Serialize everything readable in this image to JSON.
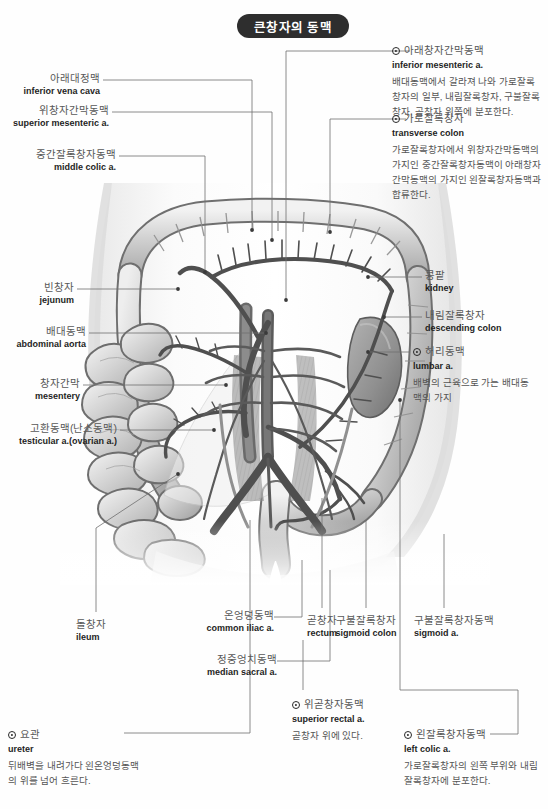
{
  "page": {
    "title_ko": "큰창자의 동맥",
    "background": "#ffffff",
    "title_pill_color": "#2e2e2e"
  },
  "illustration": {
    "name": "large-intestine-arteries-anatomy",
    "style": "grayscale-medical-illustration",
    "palette": {
      "outline": "#4a4a4a",
      "mid_gray": "#9a9a9a",
      "light_gray": "#d8d8d8",
      "vessel_dark": "#5c5c5c",
      "shadow": "#8e8e8e"
    }
  },
  "labels_left": [
    {
      "ko": "아래대정맥",
      "en": "inferior vena cava"
    },
    {
      "ko": "위창자간막동맥",
      "en": "superior mesenteric a."
    },
    {
      "ko": "중간잘록창자동맥",
      "en": "middle colic a."
    },
    {
      "ko": "빈창자",
      "en": "jejunum"
    },
    {
      "ko": "배대동맥",
      "en": "abdominal aorta"
    },
    {
      "ko": "창자간막",
      "en": "mesentery"
    },
    {
      "ko": "고환동맥(난소동맥)",
      "en": "testicular a.(ovarian a.)"
    },
    {
      "ko": "돌창자",
      "en": "ileum"
    }
  ],
  "labels_right": [
    {
      "ko": "콩팥",
      "en": "kidney"
    },
    {
      "ko": "내림잘록창자",
      "en": "descending colon"
    }
  ],
  "labels_bottom": [
    {
      "ko": "온엉덩동맥",
      "en": "common iliac a."
    },
    {
      "ko": "정중엉치동맥",
      "en": "median sacral a."
    },
    {
      "ko": "곧창자",
      "en": "rectum"
    },
    {
      "ko": "구불잘록창자",
      "en": "sigmoid colon"
    },
    {
      "ko": "구불잘록창자동맥",
      "en": "sigmoid a."
    }
  ],
  "notes": [
    {
      "id": "inferior-mesenteric",
      "ko": "아래창자간막동맥",
      "en": "inferior mesenteric a.",
      "body": "배대동맥에서 갈라져 나와 가로잘록창자의 일부, 내림잘록창자, 구불잘록창자, 곧창자 위쪽에 분포한다."
    },
    {
      "id": "transverse-colon",
      "ko": "가로잘록창자",
      "en": "transverse colon",
      "body": "가로잘록창자에서 위창자간막동맥의 가지인 중간잘록창자동맥이 아래창자간막동맥의 가지인 왼잘록창자동맥과 합류한다."
    },
    {
      "id": "lumbar",
      "ko": "허리동맥",
      "en": "lumbar a.",
      "body": "배벽의 근육으로 가는 배대동맥의 가지"
    },
    {
      "id": "superior-rectal",
      "ko": "위곧창자동맥",
      "en": "superior rectal a.",
      "body": "곧창자 위에 있다."
    },
    {
      "id": "ureter",
      "ko": "요관",
      "en": "ureter",
      "body": "뒤배벽을 내려가다 왼온엉덩동맥의 위를 넘어 흐른다."
    },
    {
      "id": "left-colic",
      "ko": "왼잘록창자동맥",
      "en": "left colic a.",
      "body": "가로잘록창자의 왼쪽 부위와 내림잘록창자에 분포한다."
    }
  ]
}
